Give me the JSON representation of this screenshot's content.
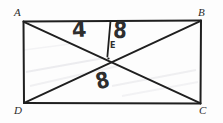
{
  "figure": {
    "kind": "hand-drawn-geometry-diagram",
    "shape": "rectangle-with-diagonals",
    "ink_color": "#1f1f1f",
    "paper_color": "#fdfdfd",
    "annotation_color": "#2e2e2e",
    "vertices": [
      {
        "id": "A",
        "label": "A",
        "corner": "top-left"
      },
      {
        "id": "B",
        "label": "B",
        "corner": "top-right"
      },
      {
        "id": "C",
        "label": "C",
        "corner": "bottom-right"
      },
      {
        "id": "D",
        "label": "D",
        "corner": "bottom-left"
      }
    ],
    "interior_points": [
      {
        "id": "E",
        "label": "E",
        "description": "intersection-of-diagonals"
      }
    ],
    "measurements": [
      {
        "id": "m1",
        "value": "4",
        "placement": "upper-left-region-above-diagonal-AC"
      },
      {
        "id": "m2",
        "value": "8",
        "placement": "upper-right-of-vertical-segment"
      },
      {
        "id": "m3",
        "value": "8",
        "placement": "lower-middle-region-below-intersection"
      }
    ],
    "segments": [
      {
        "id": "side-AB",
        "from": "A",
        "to": "B"
      },
      {
        "id": "side-BC",
        "from": "B",
        "to": "C"
      },
      {
        "id": "side-CD",
        "from": "C",
        "to": "D"
      },
      {
        "id": "side-DA",
        "from": "D",
        "to": "A"
      },
      {
        "id": "diagonal-AC",
        "from": "A",
        "to": "C"
      },
      {
        "id": "diagonal-BD",
        "from": "B",
        "to": "D"
      },
      {
        "id": "segment-top-to-E",
        "from": "AB",
        "to": "E"
      }
    ]
  }
}
